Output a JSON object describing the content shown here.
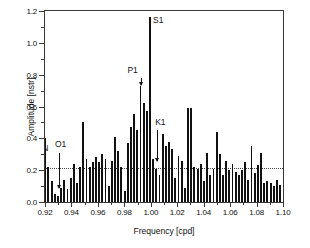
{
  "chart_data": {
    "type": "bar",
    "title": "",
    "xlabel": "Frequency [cpd]",
    "ylabel": "Amplitude [nstr]",
    "xlim": [
      0.92,
      1.1
    ],
    "ylim": [
      0.0,
      1.2
    ],
    "grid": false,
    "legend": null,
    "xticks": [
      "0.92",
      "0.94",
      "0.96",
      "0.98",
      "1.00",
      "1.02",
      "1.04",
      "1.06",
      "1.08",
      "1.10"
    ],
    "xtick_values": [
      0.92,
      0.94,
      0.96,
      0.98,
      1.0,
      1.02,
      1.04,
      1.06,
      1.08,
      1.1
    ],
    "yticks": [
      "0.0",
      "0.2",
      "0.4",
      "0.6",
      "0.8",
      "1.0",
      "1.2"
    ],
    "ytick_values": [
      0.0,
      0.2,
      0.4,
      0.6,
      0.8,
      1.0,
      1.2
    ],
    "threshold_line": {
      "value": 0.21,
      "style": "dotted"
    },
    "bar_color": "#111111",
    "x": [
      0.9202,
      0.9226,
      0.925,
      0.9274,
      0.9298,
      0.9322,
      0.9346,
      0.937,
      0.9394,
      0.9418,
      0.9442,
      0.9466,
      0.949,
      0.9514,
      0.9538,
      0.9562,
      0.9586,
      0.961,
      0.9634,
      0.9658,
      0.9682,
      0.9706,
      0.973,
      0.9754,
      0.9778,
      0.9802,
      0.9826,
      0.985,
      0.9874,
      0.9898,
      0.9922,
      0.9946,
      0.997,
      0.9994,
      1.0018,
      1.0042,
      1.0066,
      1.009,
      1.0114,
      1.0138,
      1.0162,
      1.0186,
      1.021,
      1.0234,
      1.0258,
      1.0282,
      1.0306,
      1.033,
      1.0354,
      1.0378,
      1.0402,
      1.0426,
      1.045,
      1.0474,
      1.0498,
      1.0522,
      1.0546,
      1.057,
      1.0594,
      1.0618,
      1.0642,
      1.0666,
      1.069,
      1.0714,
      1.0738,
      1.0762,
      1.0786,
      1.081,
      1.0834,
      1.0858,
      1.0882,
      1.0906,
      1.093,
      1.0954,
      1.0978
    ],
    "values": [
      0.4,
      0.22,
      0.13,
      0.05,
      0.04,
      0.09,
      0.14,
      0.08,
      0.15,
      0.24,
      0.12,
      0.22,
      0.5,
      0.27,
      0.22,
      0.25,
      0.28,
      0.25,
      0.3,
      0.27,
      0.1,
      0.26,
      0.41,
      0.32,
      0.22,
      0.07,
      0.37,
      0.47,
      0.55,
      0.45,
      0.73,
      0.62,
      0.57,
      1.16,
      0.27,
      0.21,
      0.17,
      0.43,
      0.35,
      0.38,
      0.33,
      0.15,
      0.29,
      0.26,
      0.09,
      0.59,
      0.59,
      0.22,
      0.21,
      0.24,
      0.13,
      0.31,
      0.17,
      0.21,
      0.44,
      0.3,
      0.17,
      0.26,
      0.2,
      0.24,
      0.19,
      0.17,
      0.2,
      0.25,
      0.14,
      0.35,
      0.18,
      0.23,
      0.31,
      0.12,
      0.13,
      0.12,
      0.1,
      0.14,
      0.11
    ],
    "annotations": [
      {
        "label": "N",
        "x": 0.9202,
        "value": 0.4,
        "arrow": false
      },
      {
        "label": "O1",
        "x": 0.9298,
        "value": 0.04,
        "arrow": true
      },
      {
        "label": "P1",
        "x": 0.9922,
        "value": 0.73,
        "arrow": true
      },
      {
        "label": "S1",
        "x": 0.9994,
        "value": 1.16,
        "arrow": false
      },
      {
        "label": "K1",
        "x": 1.0018,
        "value": 0.27,
        "arrow": true
      }
    ]
  }
}
